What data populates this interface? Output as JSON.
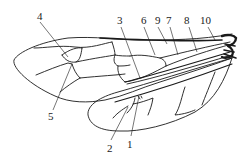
{
  "diagram": {
    "stroke_color": "#1a1a1a",
    "background": "#ffffff",
    "labels": [
      {
        "id": "1",
        "text": "1",
        "x": 128,
        "y": 143
      },
      {
        "id": "2",
        "text": "2",
        "x": 108,
        "y": 147
      },
      {
        "id": "3",
        "text": "3",
        "x": 117,
        "y": 18
      },
      {
        "id": "4",
        "text": "4",
        "x": 36,
        "y": 13
      },
      {
        "id": "5",
        "text": "5",
        "x": 49,
        "y": 117
      },
      {
        "id": "6",
        "text": "6",
        "x": 140,
        "y": 18
      },
      {
        "id": "7",
        "text": "7",
        "x": 166,
        "y": 18
      },
      {
        "id": "8",
        "text": "8",
        "x": 185,
        "y": 18
      },
      {
        "id": "9",
        "text": "9",
        "x": 154,
        "y": 18
      },
      {
        "id": "10",
        "text": "10",
        "x": 201,
        "y": 18
      }
    ]
  }
}
